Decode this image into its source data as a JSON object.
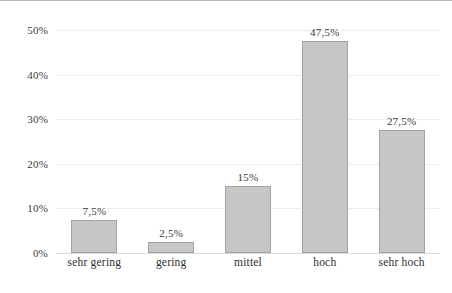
{
  "chart_data": {
    "type": "bar",
    "title": "",
    "subtitle": "",
    "xlabel": "",
    "ylabel": "",
    "categories": [
      "sehr gering",
      "gering",
      "mittel",
      "hoch",
      "sehr hoch"
    ],
    "values": [
      7.5,
      2.5,
      15,
      47.5,
      27.5
    ],
    "value_labels": [
      "7,5%",
      "2,5%",
      "15%",
      "47,5%",
      "27,5%"
    ],
    "ylim": [
      0,
      50
    ],
    "ytick_values": [
      0,
      10,
      20,
      30,
      40,
      50
    ],
    "ytick_labels": [
      "0%",
      "10%",
      "20%",
      "30%",
      "40%",
      "50%"
    ],
    "grid": true,
    "legend": "none",
    "series": [
      {
        "name": "Anteil",
        "values": [
          7.5,
          2.5,
          15,
          47.5,
          27.5
        ]
      }
    ],
    "bar_fill_color": "#c6c6c6",
    "bar_border_color": "#a2a2a2",
    "gridline_color": "#ededed",
    "text_color": "#3a3a3a"
  }
}
